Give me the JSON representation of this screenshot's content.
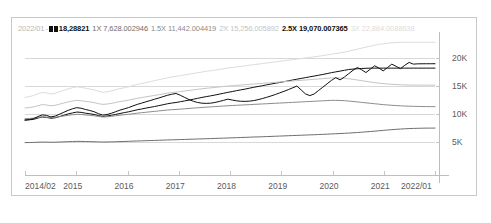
{
  "chart_data": {
    "type": "line",
    "title": "",
    "xlabel": "",
    "ylabel": "",
    "ylim": [
      0,
      24000
    ],
    "yticks": [
      5000,
      10000,
      15000,
      20000
    ],
    "ytick_labels": [
      "5K",
      "10K",
      "15K",
      "20K"
    ],
    "xtick_labels": [
      "2014/02",
      "2015",
      "2016",
      "2017",
      "2018",
      "2019",
      "2020",
      "2021",
      "2022/01"
    ],
    "grid": true,
    "legend_position": "top",
    "x_start": "2014/02",
    "x_end": "2022/01",
    "series": [
      {
        "name": "基準",
        "key": "base",
        "color": "#101010",
        "end_value": "18,28821",
        "values": [
          9050,
          9100,
          9180,
          9420,
          9600,
          9520,
          9380,
          9460,
          9680,
          9900,
          10150,
          10320,
          10480,
          10420,
          10280,
          10180,
          10050,
          9860,
          9700,
          9780,
          9900,
          10060,
          10220,
          10380,
          10520,
          10700,
          10880,
          11020,
          11180,
          11320,
          11460,
          11620,
          11780,
          11950,
          12080,
          12180,
          12320,
          12460,
          12600,
          12760,
          12920,
          13080,
          13220,
          13360,
          13500,
          13660,
          13820,
          13980,
          14120,
          14280,
          14420,
          14560,
          14720,
          14880,
          15020,
          15160,
          15320,
          15460,
          15600,
          15740,
          15880,
          16020,
          16180,
          16320,
          16460,
          16600,
          16740,
          16880,
          17020,
          17160,
          17320,
          17480,
          17620,
          17760,
          17900,
          18040,
          18120,
          18180,
          18220,
          18260,
          18280,
          18288,
          18288,
          18288,
          18288,
          18288,
          18288,
          18288,
          18288,
          18288,
          18288,
          18288,
          18288,
          18288,
          18288,
          18288
        ]
      },
      {
        "name": "1X",
        "key": "x1",
        "color": "#6e6e6e",
        "end_value": "7,628.002946",
        "values": [
          5050,
          5060,
          5080,
          5110,
          5140,
          5130,
          5110,
          5120,
          5150,
          5180,
          5210,
          5240,
          5270,
          5260,
          5240,
          5220,
          5200,
          5170,
          5150,
          5160,
          5180,
          5200,
          5230,
          5250,
          5280,
          5310,
          5340,
          5360,
          5390,
          5410,
          5440,
          5460,
          5490,
          5520,
          5540,
          5560,
          5590,
          5610,
          5640,
          5660,
          5690,
          5710,
          5740,
          5760,
          5790,
          5820,
          5840,
          5870,
          5900,
          5920,
          5950,
          5980,
          6010,
          6040,
          6060,
          6090,
          6120,
          6150,
          6180,
          6210,
          6240,
          6270,
          6300,
          6330,
          6360,
          6390,
          6420,
          6450,
          6480,
          6520,
          6550,
          6590,
          6620,
          6660,
          6700,
          6740,
          6790,
          6840,
          6900,
          6960,
          7020,
          7080,
          7150,
          7220,
          7290,
          7350,
          7410,
          7460,
          7500,
          7540,
          7570,
          7590,
          7610,
          7620,
          7625,
          7628
        ]
      },
      {
        "name": "1.5X",
        "key": "x15",
        "color": "#8c8c8c",
        "end_value": "11,442.004419",
        "values": [
          9300,
          9340,
          9400,
          9520,
          9620,
          9580,
          9500,
          9540,
          9660,
          9780,
          9900,
          10000,
          10080,
          10040,
          9960,
          9900,
          9820,
          9700,
          9600,
          9640,
          9720,
          9820,
          9920,
          10000,
          10080,
          10180,
          10280,
          10360,
          10440,
          10520,
          10600,
          10680,
          10760,
          10840,
          10900,
          10940,
          11000,
          11060,
          11120,
          11180,
          11240,
          11300,
          11350,
          11400,
          11450,
          11500,
          11550,
          11600,
          11640,
          11680,
          11720,
          11760,
          11800,
          11840,
          11880,
          11920,
          11960,
          12000,
          12040,
          12080,
          12120,
          12160,
          12200,
          12240,
          12280,
          12320,
          12360,
          12400,
          12440,
          12480,
          12520,
          12560,
          12560,
          12540,
          12500,
          12440,
          12360,
          12280,
          12200,
          12120,
          12040,
          11960,
          11880,
          11800,
          11740,
          11680,
          11630,
          11590,
          11550,
          11520,
          11500,
          11480,
          11460,
          11450,
          11445,
          11442
        ]
      },
      {
        "name": "2X",
        "key": "x2",
        "color": "#c4c4c4",
        "end_value": "15,256.005892",
        "values": [
          11200,
          11280,
          11400,
          11620,
          11800,
          11740,
          11600,
          11680,
          11880,
          12080,
          12280,
          12440,
          12560,
          12500,
          12380,
          12280,
          12160,
          11980,
          11840,
          11900,
          12020,
          12180,
          12340,
          12460,
          12600,
          12760,
          12920,
          13040,
          13180,
          13300,
          13440,
          13560,
          13700,
          13840,
          13940,
          14020,
          14120,
          14220,
          14320,
          14420,
          14520,
          14620,
          14700,
          14780,
          14860,
          14940,
          15020,
          15100,
          15160,
          15220,
          15280,
          15340,
          15400,
          15460,
          15520,
          15580,
          15640,
          15700,
          15760,
          15820,
          15880,
          15940,
          16000,
          16060,
          16120,
          16180,
          16240,
          16300,
          16360,
          16420,
          16480,
          16540,
          16560,
          16540,
          16480,
          16400,
          16300,
          16180,
          16060,
          15940,
          15820,
          15720,
          15620,
          15540,
          15470,
          15410,
          15370,
          15330,
          15300,
          15280,
          15270,
          15262,
          15258,
          15256,
          15256,
          15256
        ]
      },
      {
        "name": "2.5X",
        "key": "x25",
        "color": "#101010",
        "end_value": "19,070.007365",
        "values": [
          9060,
          9140,
          9320,
          9680,
          9980,
          9880,
          9620,
          9760,
          10100,
          10440,
          10780,
          11060,
          11260,
          11160,
          10940,
          10760,
          10540,
          10200,
          9940,
          10040,
          10260,
          10540,
          10820,
          11040,
          11280,
          11560,
          11840,
          12060,
          12300,
          12520,
          12760,
          12980,
          13220,
          13460,
          13640,
          13780,
          13460,
          13080,
          12700,
          12400,
          12180,
          12060,
          12020,
          12060,
          12180,
          12360,
          12560,
          12780,
          12620,
          12480,
          12400,
          12380,
          12420,
          12520,
          12680,
          12880,
          13100,
          13340,
          13600,
          13880,
          14160,
          14460,
          14780,
          15100,
          14400,
          13700,
          13400,
          13700,
          14300,
          14900,
          15500,
          16100,
          16600,
          16200,
          16700,
          17300,
          17900,
          18400,
          18000,
          17500,
          18100,
          18700,
          18300,
          17800,
          18400,
          19000,
          18600,
          18200,
          18800,
          19300,
          19000,
          19050,
          19060,
          19065,
          19068,
          19070
        ]
      },
      {
        "name": "3X",
        "key": "x3",
        "color": "#dcdcdc",
        "end_value": "22,884.0088638",
        "values": [
          13100,
          13220,
          13420,
          13720,
          13960,
          13880,
          13700,
          13820,
          14080,
          14340,
          14600,
          14800,
          14960,
          14880,
          14720,
          14580,
          14420,
          14180,
          14000,
          14080,
          14240,
          14440,
          14640,
          14800,
          14980,
          15180,
          15380,
          15540,
          15720,
          15880,
          16060,
          16220,
          16400,
          16580,
          16720,
          16820,
          16960,
          17080,
          17220,
          17340,
          17480,
          17600,
          17720,
          17820,
          17940,
          18060,
          18180,
          18300,
          18400,
          18500,
          18600,
          18700,
          18800,
          18900,
          19000,
          19100,
          19200,
          19300,
          19400,
          19500,
          19600,
          19700,
          19800,
          19900,
          20000,
          20100,
          20200,
          20300,
          20400,
          20520,
          20640,
          20760,
          20880,
          21000,
          21140,
          21300,
          21480,
          21660,
          21840,
          22020,
          22200,
          22360,
          22500,
          22620,
          22720,
          22800,
          22850,
          22870,
          22880,
          22884,
          22884,
          22884,
          22884,
          22884,
          22884,
          22884
        ]
      }
    ]
  },
  "legend": {
    "date": "2022/01",
    "separator": "-",
    "entries": [
      {
        "label": "",
        "value": "18,28821",
        "marker": true
      },
      {
        "label": "1X",
        "value": "7,628.002946",
        "marker": false
      },
      {
        "label": "1.5X",
        "value": "11,442.004419",
        "marker": false
      },
      {
        "label": "2X",
        "value": "15,256.005892",
        "marker": false
      },
      {
        "label": "2.5X",
        "value": "19,070.007365",
        "marker": false
      },
      {
        "label": "3X",
        "value": "22,884.0088638",
        "marker": false
      }
    ]
  },
  "axes": {
    "y_labels": [
      "20K",
      "15K",
      "10K",
      "5K"
    ],
    "x_labels": [
      "2014/02",
      "2015",
      "2016",
      "2017",
      "2018",
      "2019",
      "2020",
      "2021",
      "2022/01"
    ]
  }
}
